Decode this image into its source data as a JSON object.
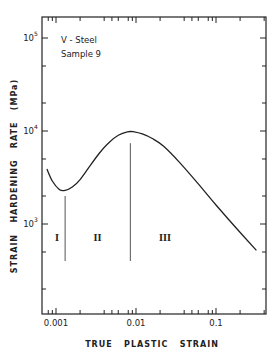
{
  "chart_data": {
    "type": "line",
    "title": "",
    "annotation": {
      "line1": "V - Steel",
      "line2": "Sample  9"
    },
    "xlabel": "TRUE   PLASTIC   STRAIN",
    "ylabel": "STRAIN   HARDENING   RATE   (MPa)",
    "xscale": "log",
    "yscale": "log",
    "xlim": [
      0.00075,
      0.45
    ],
    "ylim": [
      100,
      180000
    ],
    "x_ticks": [
      {
        "value": 0.001,
        "label": "0.001"
      },
      {
        "value": 0.01,
        "label": "0.01"
      },
      {
        "value": 0.1,
        "label": "0.1"
      }
    ],
    "y_ticks": [
      {
        "value": 1000,
        "label": "10",
        "exp": "3"
      },
      {
        "value": 10000,
        "label": "10",
        "exp": "4"
      },
      {
        "value": 100000,
        "label": "10",
        "exp": "5"
      }
    ],
    "grid": false,
    "legend": null,
    "series": [
      {
        "name": "V-Steel Sample 9",
        "x": [
          0.00077,
          0.0009,
          0.0011,
          0.0013,
          0.0016,
          0.002,
          0.0027,
          0.0035,
          0.0045,
          0.006,
          0.0078,
          0.0095,
          0.012,
          0.016,
          0.022,
          0.035,
          0.06,
          0.1,
          0.18,
          0.32
        ],
        "y": [
          3900,
          2900,
          2350,
          2300,
          2500,
          3000,
          4300,
          5800,
          7400,
          9000,
          9800,
          9800,
          9300,
          8300,
          6900,
          4600,
          2700,
          1600,
          900,
          520
        ]
      }
    ],
    "stage_boundaries": [
      {
        "x": 0.0013,
        "y_top": 2000,
        "y_bottom": 400
      },
      {
        "x": 0.0085,
        "y_top": 7400,
        "y_bottom": 400
      }
    ],
    "stage_labels": [
      {
        "text": "I",
        "x": 0.00103,
        "y": 700
      },
      {
        "text": "II",
        "x": 0.0033,
        "y": 700
      },
      {
        "text": "III",
        "x": 0.023,
        "y": 700
      }
    ]
  }
}
